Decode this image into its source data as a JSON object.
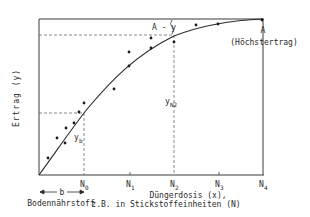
{
  "chart_data": {
    "type": "scatter",
    "title": "",
    "xlabel": "Düngerdosis (x), z.B. in Stickstoffeinheiten (N)",
    "xlabel_line1": "Düngerdosis (x),",
    "xlabel_line2": "z.B. in Stickstoffeinheiten (N)",
    "ylabel": "Ertrag (y)",
    "x_ticks": [
      "N0",
      "N1",
      "N2",
      "N3",
      "N4"
    ],
    "x_tick_labels": [
      {
        "base": "N",
        "sub": "0"
      },
      {
        "base": "N",
        "sub": "1"
      },
      {
        "base": "N",
        "sub": "2"
      },
      {
        "base": "N",
        "sub": "3"
      },
      {
        "base": "N",
        "sub": "4"
      }
    ],
    "grid": false,
    "annotations": {
      "max_label": "A",
      "max_desc": "(Höchstertrag)",
      "gap_label": "A - y",
      "y_b": {
        "base": "y",
        "sub": "b"
      },
      "y_n2": {
        "base": "y",
        "sub": "N2"
      },
      "b_label": "b",
      "soil_label": "Bodennährstoff"
    },
    "series": [
      {
        "name": "Beobachtungen",
        "type": "scatter",
        "points_px": [
          [
            48,
            158
          ],
          [
            57,
            138
          ],
          [
            66,
            128
          ],
          [
            65,
            143
          ],
          [
            74,
            123
          ],
          [
            79,
            112
          ],
          [
            84,
            103
          ],
          [
            114,
            89
          ],
          [
            129,
            66
          ],
          [
            129,
            52
          ],
          [
            151,
            48
          ],
          [
            151,
            38
          ],
          [
            174,
            42
          ],
          [
            196,
            25
          ],
          [
            218,
            24
          ],
          [
            262,
            20
          ]
        ]
      },
      {
        "name": "Ertragskurve",
        "type": "line",
        "path": "M39,175 C60,146 75,124 88,108 C110,82 135,55 174,36 C205,24 235,20 263,19"
      }
    ],
    "axes_px": {
      "left": 39,
      "top": 19,
      "right": 265,
      "bottom": 175
    },
    "tick_x_px": [
      84,
      130,
      174,
      219,
      263
    ],
    "yb_level_px": 113,
    "yn2_level_px": 35,
    "ylim": [
      0,
      "A"
    ],
    "xlim": [
      0,
      "N4"
    ]
  }
}
